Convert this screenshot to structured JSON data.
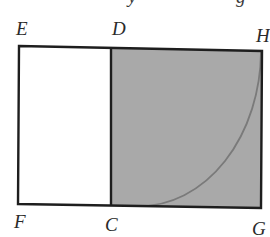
{
  "figure": {
    "colors": {
      "outline": "#1e1e1e",
      "shaded_fill": "#a9a9a9",
      "unshaded_fill": "#ffffff",
      "arc": "#7a7a7a",
      "label": "#2a2a2a"
    },
    "labels": {
      "E": "E",
      "D": "D",
      "H": "H",
      "F": "F",
      "C": "C",
      "G": "G"
    },
    "cropped_top_text": {
      "left_fragment": "y",
      "right_fragment": "g"
    },
    "regions": [
      {
        "name": "rectangle-EDCF",
        "shaded": false
      },
      {
        "name": "square-DHGC",
        "shaded": true
      }
    ],
    "arc": {
      "from": "C",
      "to": "H",
      "center": "G",
      "type": "quarter-circle"
    }
  }
}
